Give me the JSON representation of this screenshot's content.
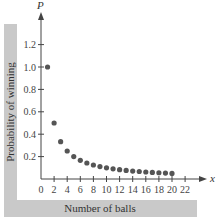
{
  "chart_data": {
    "type": "scatter",
    "title": "",
    "xlabel": "Number of balls",
    "ylabel": "Probability of winning",
    "x_axis_symbol": "x",
    "y_axis_symbol": "P",
    "xlim": [
      0,
      22
    ],
    "ylim": [
      0,
      1.2
    ],
    "x_ticks": [
      0,
      2,
      4,
      6,
      8,
      10,
      12,
      14,
      16,
      18,
      20,
      22
    ],
    "y_ticks": [
      0.2,
      0.4,
      0.6,
      0.8,
      1.0,
      1.2
    ],
    "y_tick_labels": [
      "0.2",
      "0.4",
      "0.6",
      "0.8",
      "1.0",
      "1.2"
    ],
    "grid": false,
    "legend": null,
    "x": [
      1,
      2,
      3,
      4,
      5,
      6,
      7,
      8,
      9,
      10,
      11,
      12,
      13,
      14,
      15,
      16,
      17,
      18,
      19,
      20
    ],
    "values": [
      1.0,
      0.5,
      0.333,
      0.25,
      0.2,
      0.167,
      0.143,
      0.125,
      0.111,
      0.1,
      0.091,
      0.083,
      0.077,
      0.071,
      0.067,
      0.0625,
      0.059,
      0.056,
      0.053,
      0.05
    ],
    "point_color": "#555555",
    "frame_color": "#c9c9c9"
  }
}
